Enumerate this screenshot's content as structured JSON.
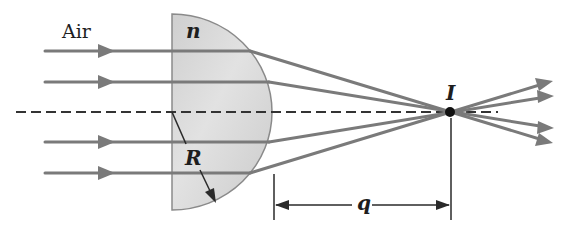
{
  "figure": {
    "labels": {
      "medium": "Air",
      "index": "n",
      "radius": "R",
      "image_point": "I",
      "image_distance": "q"
    },
    "colors": {
      "ray": "#7a7a7a",
      "lens_fill": "#d6d6d6",
      "lens_edge": "#8a8a8a",
      "axis": "#333333",
      "dimension": "#2a2a2a",
      "image_dot": "#111111"
    },
    "geometry": {
      "axis_y": 112,
      "lens_flat_x": 172,
      "lens_radius": 100,
      "focus": [
        450,
        112
      ],
      "incoming_ray_y": [
        51,
        82,
        142,
        173
      ],
      "ray_start_x": 45
    }
  }
}
